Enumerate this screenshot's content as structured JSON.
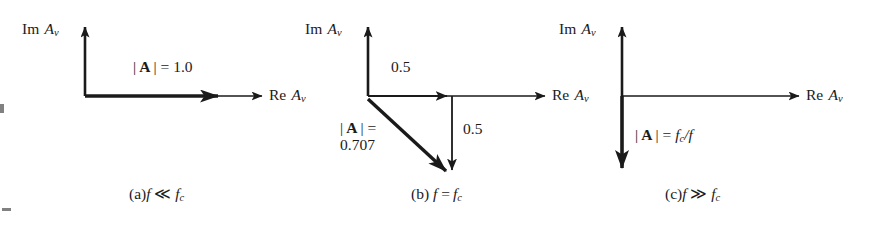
{
  "figure": {
    "type": "phasor-diagram-set",
    "background_color": "#ffffff",
    "ink_color": "#1a1a1a",
    "panels": [
      {
        "id": "a",
        "caption_prefix": "(a)",
        "caption_expr_lhs": "f",
        "caption_relation": "≪",
        "caption_expr_rhs_base": "f",
        "caption_expr_rhs_sub": "c",
        "caption_plain": "(a) f ≪ f_c",
        "axis_im_label_prefix": "Im",
        "axis_im_label_base": "A",
        "axis_im_label_sub": "v",
        "axis_re_label_prefix": "Re",
        "axis_re_label_base": "A",
        "axis_re_label_sub": "v",
        "magnitude_label_plain": "| A | = 1.0",
        "magnitude_bar": "|",
        "magnitude_symbol": "A",
        "magnitude_equals": "| =",
        "magnitude_value": "1.0",
        "vector_direction": "real-positive",
        "vector_angle_deg": 0,
        "vector_magnitude": 1.0,
        "components": []
      },
      {
        "id": "b",
        "caption_prefix": "(b)",
        "caption_expr_lhs": "f",
        "caption_relation": "=",
        "caption_expr_rhs_base": "f",
        "caption_expr_rhs_sub": "c",
        "caption_plain": "(b) f = f_c",
        "axis_im_label_prefix": "Im",
        "axis_im_label_base": "A",
        "axis_im_label_sub": "v",
        "axis_re_label_prefix": "Re",
        "axis_re_label_base": "A",
        "axis_re_label_sub": "v",
        "magnitude_label_plain": "| A | = 0.707",
        "magnitude_bar": "|",
        "magnitude_symbol": "A",
        "magnitude_equals": "| =",
        "magnitude_value": "0.707",
        "vector_direction": "fourth-quadrant",
        "vector_angle_deg": -45,
        "vector_magnitude": 0.707,
        "components": [
          {
            "name": "real-component",
            "label": "0.5",
            "value": 0.5,
            "orientation": "horizontal"
          },
          {
            "name": "imaginary-component",
            "label": "0.5",
            "value": -0.5,
            "orientation": "vertical"
          }
        ]
      },
      {
        "id": "c",
        "caption_prefix": "(c)",
        "caption_expr_lhs": "f",
        "caption_relation": "≫",
        "caption_expr_rhs_base": "f",
        "caption_expr_rhs_sub": "c",
        "caption_plain": "(c) f ≫ f_c",
        "axis_im_label_prefix": "Im",
        "axis_im_label_base": "A",
        "axis_im_label_sub": "v",
        "axis_re_label_prefix": "Re",
        "axis_re_label_base": "A",
        "axis_re_label_sub": "v",
        "magnitude_label_plain": "| A | = f_c/f",
        "magnitude_bar": "|",
        "magnitude_symbol": "A",
        "magnitude_equals": "| =",
        "magnitude_value_base": "f",
        "magnitude_value_sub": "c",
        "magnitude_value_tail": "/f",
        "vector_direction": "imaginary-negative",
        "vector_angle_deg": -90,
        "vector_magnitude": null,
        "components": []
      }
    ]
  }
}
